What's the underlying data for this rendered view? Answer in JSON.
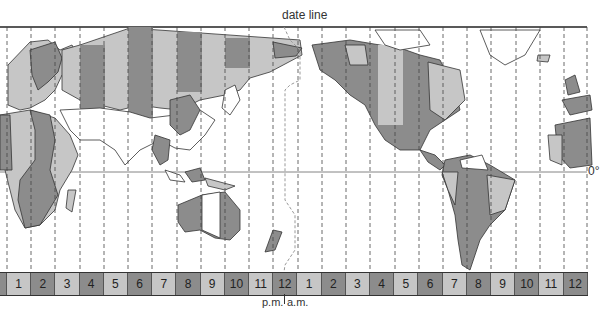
{
  "labels": {
    "date_line": "date line",
    "equator": "0°",
    "pm": "p.m.",
    "am": "a.m."
  },
  "colors": {
    "land_dark": "#8c8c8c",
    "land_light": "#c6c6c6",
    "land_white": "#ffffff",
    "outline": "#333333"
  },
  "hour_bar": {
    "pm_hours": [
      "1",
      "2",
      "3",
      "4",
      "5",
      "6",
      "7",
      "8",
      "9",
      "10",
      "11",
      "12"
    ],
    "am_hours": [
      "1",
      "2",
      "3",
      "4",
      "5",
      "6",
      "7",
      "8",
      "9",
      "10",
      "11",
      "12"
    ],
    "pattern": "alternating light/dark starting light"
  },
  "map": {
    "title": "World time zones",
    "features": [
      "Europe",
      "Africa",
      "Asia",
      "Australia",
      "New Zealand",
      "North America",
      "South America",
      "Greenland"
    ],
    "zone_line_spacing_px": 24.25
  }
}
